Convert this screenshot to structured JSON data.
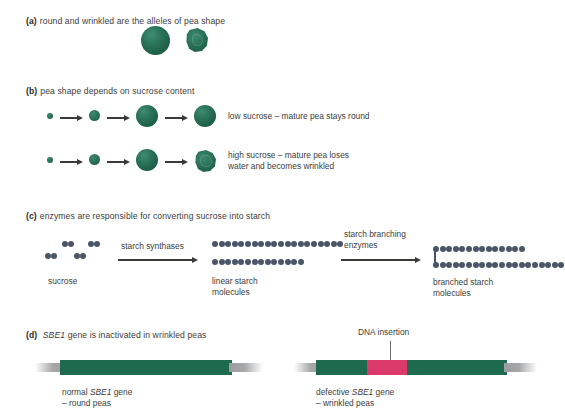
{
  "figure": {
    "colors": {
      "pea_green": "#1d6a4f",
      "insertion_pink": "#d93a6a",
      "molecule_blue": "#4a5568",
      "arrow_dark": "#3c3a38",
      "gene_tail_gray": "#a6a8aa",
      "text": "#3d3d3d"
    }
  },
  "panel_a": {
    "tag": "(a)",
    "heading": "round and wrinkled are the alleles of pea shape",
    "shapes": [
      {
        "name": "round-pea",
        "type": "round"
      },
      {
        "name": "wrinkled-pea",
        "type": "wrinkled"
      }
    ]
  },
  "panel_b": {
    "tag": "(b)",
    "heading": "pea shape depends on sucrose content",
    "rows": [
      {
        "name": "low-sucrose-row",
        "caption": "low sucrose – mature pea stays round",
        "stages": [
          "tiny",
          "small",
          "large",
          "large"
        ],
        "final_shape": "round"
      },
      {
        "name": "high-sucrose-row",
        "caption": "high sucrose – mature pea loses\nwater and becomes wrinkled",
        "stages": [
          "tiny",
          "small",
          "large",
          "wrinkled"
        ],
        "final_shape": "wrinkled"
      }
    ]
  },
  "panel_c": {
    "tag": "(c)",
    "heading": "enzymes are responsible for converting sucrose into starch",
    "stage1": {
      "label": "sucrose",
      "pairs": 4,
      "dots_per_pair": 2
    },
    "enzyme1": {
      "label": "starch synthases"
    },
    "stage2": {
      "label": "linear starch\nmolecules",
      "chains": [
        20,
        14
      ]
    },
    "enzyme2": {
      "label": "starch branching\nenzymes"
    },
    "stage3": {
      "label": "branched starch\nmolecules",
      "chains": [
        14,
        20
      ],
      "has_branch_link": true
    }
  },
  "panel_d": {
    "tag": "(d)",
    "heading_gene": "SBE1",
    "heading_rest": "gene is inactivated in wrinkled peas",
    "insertion_label": "DNA insertion",
    "genes": [
      {
        "name": "normal-gene",
        "caption_pre": "normal ",
        "caption_gene": "SBE1",
        "caption_post": " gene",
        "caption_line2": "– round peas",
        "segments": [
          {
            "type": "green",
            "left": 0,
            "width": 200
          }
        ]
      },
      {
        "name": "defective-gene",
        "caption_pre": "defective ",
        "caption_gene": "SBE1",
        "caption_post": " gene",
        "caption_line2": "– wrinkled peas",
        "segments": [
          {
            "type": "green",
            "left": 0,
            "width": 50
          },
          {
            "type": "insert",
            "left": 50,
            "width": 39
          },
          {
            "type": "green",
            "left": 89,
            "width": 111
          }
        ]
      }
    ]
  }
}
